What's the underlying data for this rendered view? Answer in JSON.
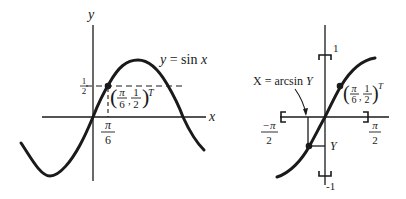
{
  "left_graph": {
    "y_axis_label": "y",
    "x_axis_label": "x",
    "curve_label": "y = sin x",
    "half_tick": {
      "num": "1",
      "den": "2"
    },
    "pi6_tick": {
      "num": "π",
      "den": "6"
    },
    "point_label": {
      "x_num": "π",
      "x_den": "6",
      "y_num": "1",
      "y_den": "2",
      "superscript": "T"
    }
  },
  "right_graph": {
    "top_label": "1",
    "bottom_label": "-1",
    "left_label": {
      "num": "−π",
      "den": "2"
    },
    "right_label": {
      "num": "π",
      "den": "2"
    },
    "arrow_label": "X = arcsin Y",
    "Y_label": "Y",
    "point_label": {
      "x_num": "π",
      "x_den": "6",
      "y_num": "1",
      "y_den": "2",
      "superscript": "T"
    }
  },
  "colors": {
    "ink": "#1a1a1a",
    "background": "#ffffff"
  }
}
